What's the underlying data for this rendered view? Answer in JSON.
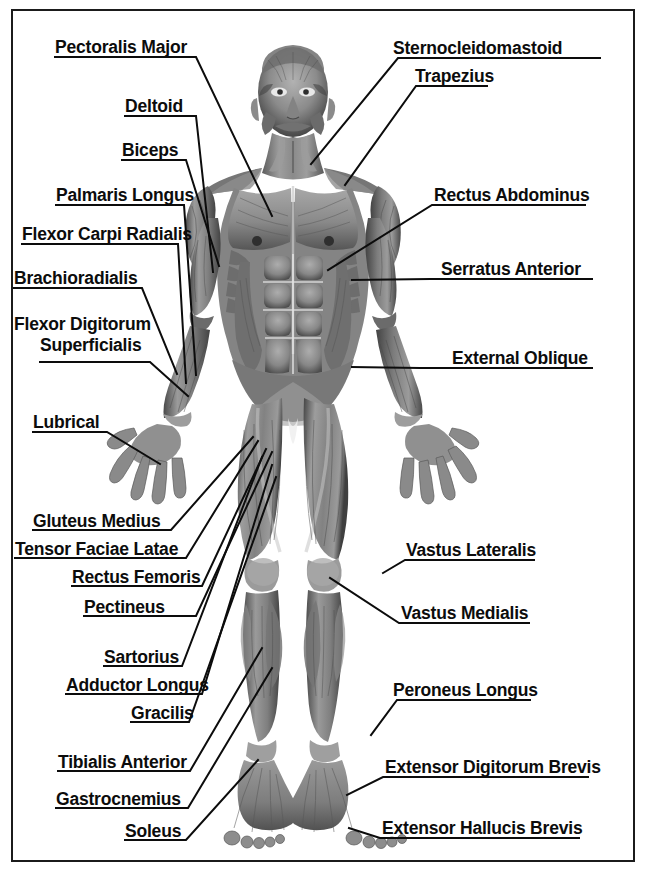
{
  "diagram": {
    "frame_color": "#1b1b1b",
    "background_color": "#ffffff",
    "label_color": "#0c0c0c",
    "leader_line_color": "#0c0c0c"
  },
  "labels_left": [
    {
      "id": "pectoralis-major",
      "text": "Pectoralis Major"
    },
    {
      "id": "deltoid",
      "text": "Deltoid"
    },
    {
      "id": "biceps",
      "text": "Biceps"
    },
    {
      "id": "palmaris-longus",
      "text": "Palmaris Longus"
    },
    {
      "id": "flexor-carpi-radialis",
      "text": "Flexor Carpi Radialis"
    },
    {
      "id": "brachioradialis",
      "text": "Brachioradialis"
    },
    {
      "id": "flexor-digitorum-superficialis-line1",
      "text": "Flexor Digitorum"
    },
    {
      "id": "flexor-digitorum-superficialis-line2",
      "text": "Superficialis"
    },
    {
      "id": "lubrical",
      "text": "Lubrical"
    },
    {
      "id": "gluteus-medius",
      "text": "Gluteus Medius"
    },
    {
      "id": "tensor-faciae-latae",
      "text": "Tensor Faciae Latae"
    },
    {
      "id": "rectus-femoris",
      "text": "Rectus Femoris"
    },
    {
      "id": "pectineus",
      "text": "Pectineus"
    },
    {
      "id": "sartorius",
      "text": "Sartorius"
    },
    {
      "id": "adductor-longus",
      "text": "Adductor Longus"
    },
    {
      "id": "gracilis",
      "text": "Gracilis"
    },
    {
      "id": "tibialis-anterior",
      "text": "Tibialis Anterior"
    },
    {
      "id": "gastrocnemius",
      "text": "Gastrocnemius"
    },
    {
      "id": "soleus",
      "text": "Soleus"
    }
  ],
  "labels_right": [
    {
      "id": "sternocleidomastoid",
      "text": "Sternocleidomastoid"
    },
    {
      "id": "trapezius",
      "text": "Trapezius"
    },
    {
      "id": "rectus-abdominus",
      "text": "Rectus Abdominus"
    },
    {
      "id": "serratus-anterior",
      "text": "Serratus Anterior"
    },
    {
      "id": "external-oblique",
      "text": "External Oblique"
    },
    {
      "id": "vastus-lateralis",
      "text": "Vastus Lateralis"
    },
    {
      "id": "vastus-medialis",
      "text": "Vastus Medialis"
    },
    {
      "id": "peroneus-longus",
      "text": "Peroneus Longus"
    },
    {
      "id": "extensor-digitorum-brevis",
      "text": "Extensor Digitorum Brevis"
    },
    {
      "id": "extensor-hallucis-brevis",
      "text": "Extensor Hallucis Brevis"
    }
  ]
}
